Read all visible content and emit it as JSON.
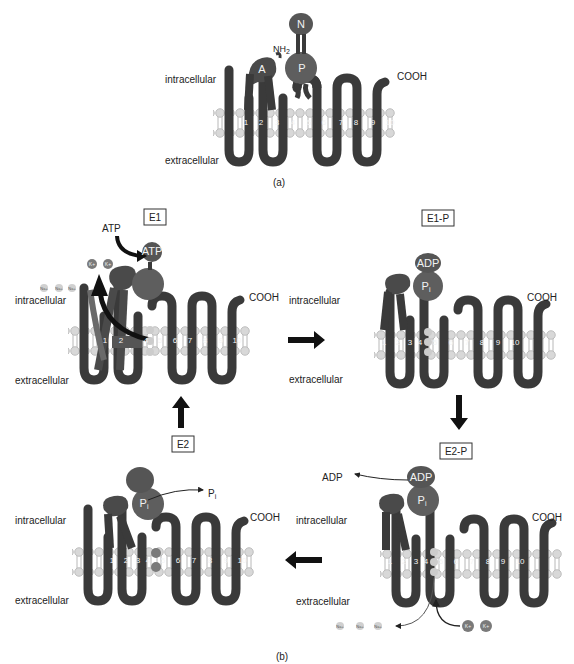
{
  "colors": {
    "protein": "#3a3a3a",
    "domain_a": "#4a4a4a",
    "domain_p": "#5e5e5e",
    "domain_n": "#565656",
    "lipid_head": "#d6d6d6",
    "lipid_stroke": "#b0b0b0",
    "arrow": "#111111",
    "ion_k": "#7a7a7a",
    "ion_na": "#d0d0d0"
  },
  "panel_a": {
    "caption": "(a)",
    "intracellular": "intracellular",
    "extracellular": "extracellular",
    "domains": {
      "n": "N",
      "p": "P",
      "a": "A"
    },
    "nh2": "NH2",
    "nh2_base": "NH",
    "nh2_sub": "2",
    "cooh": "COOH",
    "helices": [
      "1",
      "2",
      "3",
      "4",
      "5",
      "6",
      "7",
      "8",
      "9",
      "10"
    ]
  },
  "panel_b": {
    "caption": "(b)",
    "states": {
      "e1": {
        "label": "E1",
        "intracellular": "intracellular",
        "extracellular": "extracellular",
        "cooh": "COOH",
        "atp_in": "ATP",
        "atp_bound": "ATP",
        "k_ions": [
          "K+",
          "K+"
        ],
        "na_ions": [
          "Na+",
          "Na+",
          "Na+"
        ]
      },
      "e1p": {
        "label": "E1-P",
        "intracellular": "intracellular",
        "extracellular": "extracellular",
        "cooh": "COOH",
        "adp": "ADP",
        "pi": "P",
        "pi_sub": "i"
      },
      "e2p": {
        "label": "E2-P",
        "intracellular": "intracellular",
        "extracellular": "extracellular",
        "cooh": "COOH",
        "adp_out": "ADP",
        "adp": "ADP",
        "pi": "P",
        "pi_sub": "i",
        "na_ions": [
          "Na+",
          "Na+",
          "Na+"
        ],
        "k_ions": [
          "K+",
          "K+"
        ]
      },
      "e2": {
        "label": "E2",
        "intracellular": "intracellular",
        "extracellular": "extracellular",
        "cooh": "COOH",
        "pi": "P",
        "pi_sub": "i",
        "pi_out": "P",
        "pi_out_sub": "i",
        "k_ions": [
          "K+",
          "K+"
        ]
      }
    },
    "helices": [
      "1",
      "2",
      "3",
      "4",
      "5",
      "6",
      "7",
      "8",
      "9",
      "10"
    ],
    "cycle_arrows": [
      "E1 → E1-P",
      "E1-P → E2-P",
      "E2-P → E2",
      "E2 → E1"
    ]
  }
}
